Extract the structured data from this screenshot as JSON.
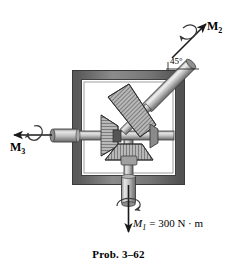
{
  "figure": {
    "caption": "Prob. 3–62",
    "background": "#ffffff",
    "labels": {
      "m2": {
        "symbol": "M",
        "sub": "2"
      },
      "m3": {
        "symbol": "M",
        "sub": "3"
      },
      "m1": {
        "symbol": "M",
        "sub": "1",
        "equals": "= 300 N · m"
      },
      "angle": "45°"
    },
    "colors": {
      "frame_fill": "#7a7a7a",
      "frame_dark": "#4a4a4a",
      "frame_light": "#a6a6a6",
      "shaft_light": "#d2d2d2",
      "shaft_mid": "#9a9a9a",
      "shaft_dark": "#6e6e6e",
      "gear_fill": "#b5b5b5",
      "gear_dark": "#5c5c5c",
      "outline": "#2b2b2b",
      "arrow": "#1a1a1a"
    },
    "icon_names": {
      "m2_arrow": "arrow-up-right-icon",
      "m3_arrow": "arrow-left-icon",
      "m1_arrow": "arrow-down-icon",
      "m2_curl": "rotation-curl-icon",
      "m3_curl": "rotation-curl-icon",
      "m1_curl": "rotation-curl-icon"
    },
    "parts": {
      "frame": "square-frame",
      "shaft_horizontal": "horizontal-shaft",
      "shaft_diagonal": "diagonal-shaft-45deg",
      "shaft_vertical": "vertical-shaft",
      "gear_left": "bevel-gear-left",
      "gear_diagonal": "bevel-gear-diagonal",
      "gear_bottom": "bevel-gear-bottom"
    }
  }
}
